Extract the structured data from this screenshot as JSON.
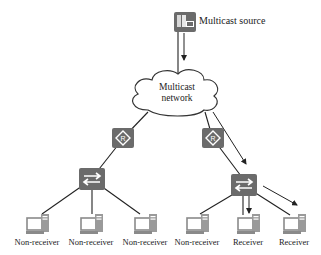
{
  "diagram": {
    "source": {
      "label": "Multicast source",
      "icon": "server-icon"
    },
    "network": {
      "label_line1": "Multicast",
      "label_line2": "network",
      "icon": "cloud-icon"
    },
    "routers": [
      {
        "id": "router-left",
        "icon": "router-icon",
        "glyph": "R"
      },
      {
        "id": "router-right",
        "icon": "router-icon",
        "glyph": "R"
      }
    ],
    "switches": [
      {
        "id": "switch-left",
        "icon": "switch-icon"
      },
      {
        "id": "switch-right",
        "icon": "switch-icon"
      }
    ],
    "hosts": [
      {
        "label": "Non-receiver",
        "icon": "pc-icon"
      },
      {
        "label": "Non-receiver",
        "icon": "pc-icon"
      },
      {
        "label": "Non-receiver",
        "icon": "pc-icon"
      },
      {
        "label": "Non-receiver",
        "icon": "pc-icon"
      },
      {
        "label": "Receiver",
        "icon": "pc-icon"
      },
      {
        "label": "Receiver",
        "icon": "pc-icon"
      }
    ],
    "colors": {
      "device_fill": "#6b6b6b",
      "device_glyph": "#ffffff",
      "line": "#222222",
      "pc_outline": "#888888"
    }
  }
}
